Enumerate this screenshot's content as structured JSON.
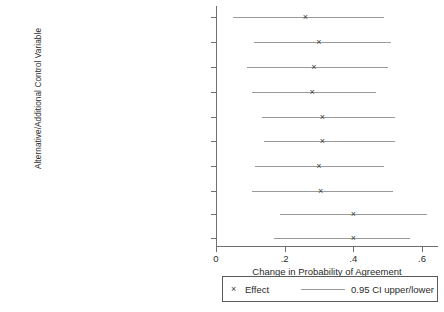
{
  "chart_data": {
    "type": "scatter",
    "title": "",
    "xlabel": "Change in Probability of Agreement",
    "ylabel": "Alternative/Additional Control Variable",
    "xlim": [
      0,
      0.6
    ],
    "xticks": [
      0,
      0.2,
      0.4,
      0.6
    ],
    "xticklabels": [
      "0",
      ".2",
      ".4",
      ".6"
    ],
    "grid": false,
    "legend_position": "below-axis",
    "legend": [
      {
        "marker": "x",
        "label": "Effect"
      },
      {
        "marker": "line",
        "label": "0.95 CI upper/lower"
      }
    ],
    "categories": [
      "Use Country Dummies",
      "Use Personnel Ratio",
      "Use Capability Ratio",
      "High Deviation from Exp(Mil Personnel)",
      "Any Participant at War",
      "All Participants at War",
      "Min(Time Since Last War)",
      "Conscription",
      "Any Leader Change",
      "All Leader Change"
    ],
    "points": [
      {
        "category": "Use Country Dummies",
        "effect": 0.26,
        "ci_lower": 0.05,
        "ci_upper": 0.49
      },
      {
        "category": "Use Personnel Ratio",
        "effect": 0.3,
        "ci_lower": 0.11,
        "ci_upper": 0.51
      },
      {
        "category": "Use Capability Ratio",
        "effect": 0.285,
        "ci_lower": 0.09,
        "ci_upper": 0.5
      },
      {
        "category": "High Deviation from Exp(Mil Personnel)",
        "effect": 0.28,
        "ci_lower": 0.105,
        "ci_upper": 0.465
      },
      {
        "category": "Any Participant at War",
        "effect": 0.31,
        "ci_lower": 0.135,
        "ci_upper": 0.52
      },
      {
        "category": "All Participants at War",
        "effect": 0.31,
        "ci_lower": 0.14,
        "ci_upper": 0.52
      },
      {
        "category": "Min(Time Since Last War)",
        "effect": 0.3,
        "ci_lower": 0.115,
        "ci_upper": 0.49
      },
      {
        "category": "Conscription",
        "effect": 0.305,
        "ci_lower": 0.105,
        "ci_upper": 0.515
      },
      {
        "category": "Any Leader Change",
        "effect": 0.4,
        "ci_lower": 0.185,
        "ci_upper": 0.615
      },
      {
        "category": "All Leader Change",
        "effect": 0.4,
        "ci_lower": 0.17,
        "ci_upper": 0.565
      }
    ],
    "marker_glyph": "×"
  }
}
